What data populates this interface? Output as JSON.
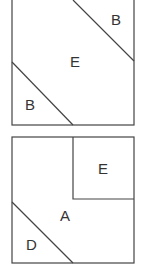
{
  "diagrams": [
    {
      "name": "top-square",
      "regions": [
        {
          "label": "B",
          "position": "top-right"
        },
        {
          "label": "E",
          "position": "center"
        },
        {
          "label": "B",
          "position": "bottom-left"
        }
      ]
    },
    {
      "name": "bottom-square",
      "regions": [
        {
          "label": "E",
          "position": "top-right"
        },
        {
          "label": "A",
          "position": "center"
        },
        {
          "label": "D",
          "position": "bottom-left"
        }
      ]
    }
  ],
  "colors": {
    "stroke": "#444444",
    "text": "#333333",
    "background": "#ffffff"
  }
}
